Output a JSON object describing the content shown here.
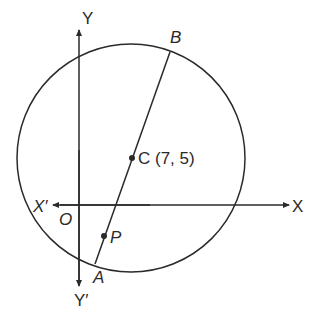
{
  "diagram": {
    "axes": {
      "x_positive_label": "X",
      "x_negative_label": "X′",
      "y_positive_label": "Y",
      "y_negative_label": "Y′",
      "origin_label": "O"
    },
    "points": {
      "center_label": "C (7, 5)",
      "b_label": "B",
      "a_label": "A",
      "p_label": "P"
    },
    "colors": {
      "stroke": "#2a2a2a",
      "background": "#ffffff"
    }
  }
}
